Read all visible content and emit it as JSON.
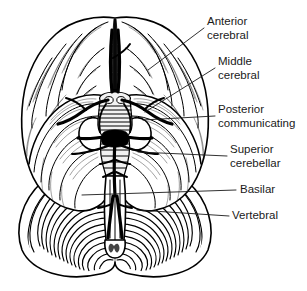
{
  "figure": {
    "background_color": "#ffffff",
    "ink_color": "#000000",
    "text_color": "#1a1a1a",
    "view": "inferior (ventral) view",
    "width": 307,
    "height": 291
  },
  "labels": [
    {
      "id": "anterior-cerebral",
      "line1": "Anterior",
      "line2": "cerebral",
      "text_x": 207,
      "text_y1": 22,
      "text_y2": 36,
      "leader": "M 204 28 L 148 70"
    },
    {
      "id": "middle-cerebral",
      "line1": "Middle",
      "line2": "cerebral",
      "text_x": 218,
      "text_y1": 62,
      "text_y2": 76,
      "leader": "M 215 68 L 145 112"
    },
    {
      "id": "posterior-communicating",
      "line1": "Posterior",
      "line2": "communicating",
      "text_x": 218,
      "text_y1": 110,
      "text_y2": 124,
      "leader": "M 215 116 L 143 120"
    },
    {
      "id": "superior-cerebellar",
      "line1": "Superior",
      "line2": "cerebellar",
      "text_x": 230,
      "text_y1": 150,
      "text_y2": 164,
      "leader": "M 227 156 L 138 152"
    },
    {
      "id": "basilar",
      "line1": "Basilar",
      "line2": "",
      "text_x": 240,
      "text_y1": 190,
      "text_y2": 0,
      "leader": "M 236 190 L 82 195"
    },
    {
      "id": "vertebral",
      "line1": "Vertebral",
      "line2": "",
      "text_x": 232,
      "text_y1": 216,
      "text_y2": 0,
      "leader": "M 229 216 L 137 210"
    }
  ],
  "anatomy": {
    "frontal_lobe": "frontal lobe",
    "temporal_lobe": "temporal lobe",
    "occipital_lobe": "occipital lobe",
    "cerebellum": "cerebellum",
    "brainstem": "brainstem",
    "medulla": "medulla oblongata",
    "longitudinal_fissure": "longitudinal fissure",
    "circle_of_willis": "circle of Willis"
  }
}
